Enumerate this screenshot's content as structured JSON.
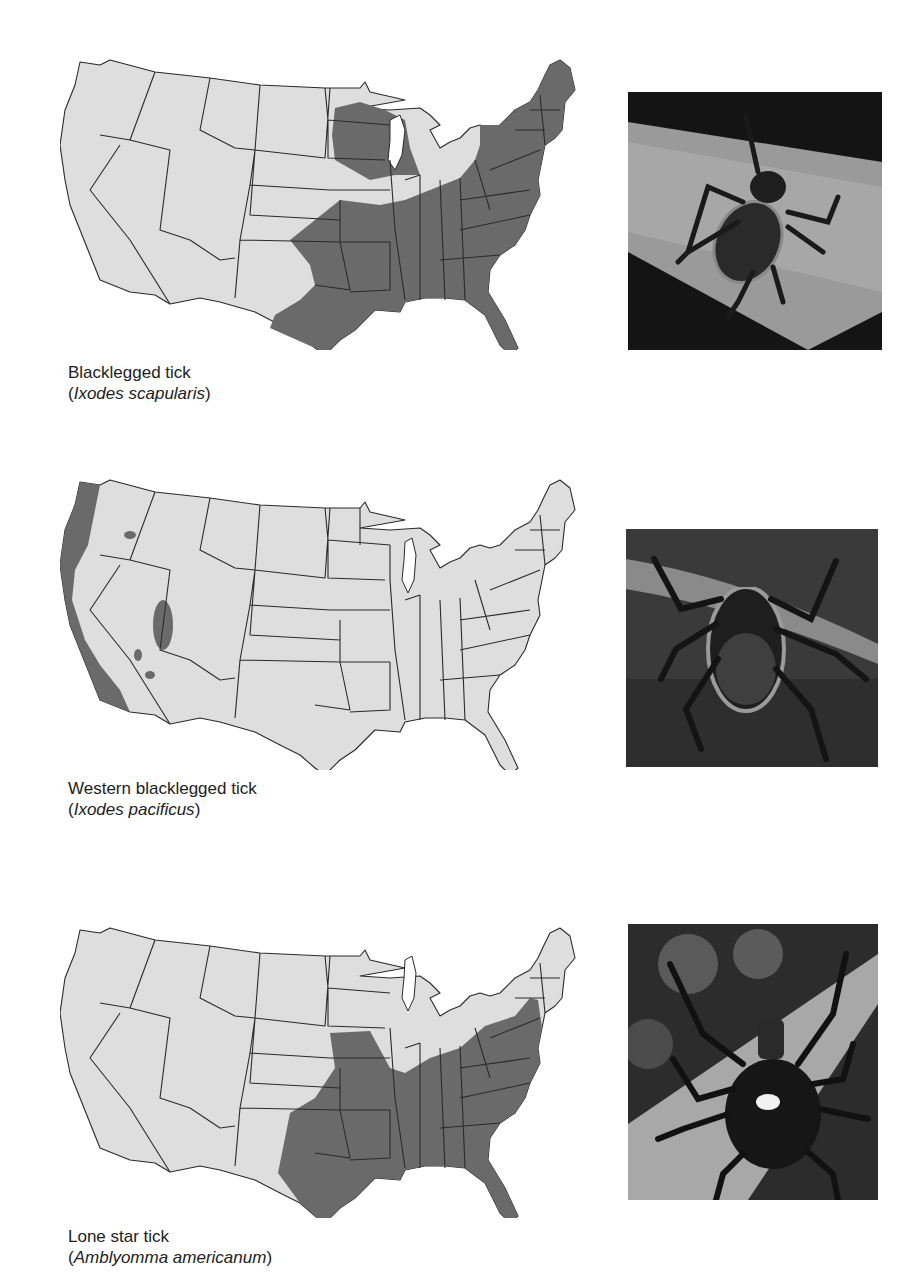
{
  "figure": {
    "panels": [
      {
        "common_name": "Blacklegged tick",
        "scientific_name": "Ixodes scapularis",
        "range_description": "Eastern United States: Northeast, upper Midwest (Minnesota/Wisconsin), mid-Atlantic, Southeast, and eastern Texas/Oklahoma",
        "photo_alt": "Blacklegged tick on a leaf"
      },
      {
        "common_name": "Western blacklegged tick",
        "scientific_name": "Ixodes pacificus",
        "range_description": "Pacific coast (Washington, Oregon, California) with small isolated patches in Idaho, Utah, Nevada and Arizona",
        "photo_alt": "Western blacklegged tick on a twig"
      },
      {
        "common_name": "Lone star tick",
        "scientific_name": "Amblyomma americanum",
        "range_description": "Southeastern and south-central United States from Texas/Oklahoma to the Atlantic coast, north to Missouri, Kentucky, Virginia, Maryland and New Jersey",
        "photo_alt": "Lone star tick with white spot on back"
      }
    ],
    "colors": {
      "range_fill": "#6a6a6a",
      "state_fill": "#dedede",
      "border": "#2a2a2a",
      "background": "#ffffff"
    }
  }
}
